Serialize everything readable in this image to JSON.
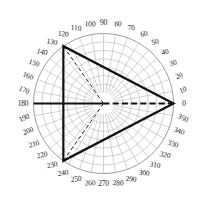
{
  "chart_data": {
    "type": "line",
    "title": "",
    "subtitle": "",
    "xlabel": "",
    "ylabel": "",
    "coordinate_system": "polar",
    "angular_unit": "degrees",
    "angular_range": [
      0,
      360
    ],
    "angular_tick_step": 10,
    "angular_tick_labels": [
      "0",
      "10",
      "20",
      "30",
      "40",
      "50",
      "60",
      "70",
      "80",
      "90",
      "100",
      "110",
      "120",
      "130",
      "140",
      "150",
      "160",
      "170",
      "180",
      "190",
      "200",
      "210",
      "220",
      "230",
      "240",
      "250",
      "260",
      "270",
      "280",
      "290",
      "300",
      "310",
      "320",
      "330",
      "340",
      "350"
    ],
    "angular_direction": "counterclockwise",
    "zero_angle_position": "east",
    "radial_rings": 7,
    "radial_inner_hole": true,
    "radial_tick_labels": [],
    "grid": true,
    "legend": false,
    "legend_position": "none",
    "series": [
      {
        "name": "triangle-envelope",
        "style": "solid-bold",
        "closed": true,
        "points": [
          {
            "angle": 0,
            "radius": 1.0
          },
          {
            "angle": 125,
            "radius": 1.0
          },
          {
            "angle": 235,
            "radius": 1.0
          }
        ]
      },
      {
        "name": "radial-ray-0",
        "style": "dashed-bold",
        "closed": false,
        "points": [
          {
            "angle": 0,
            "radius": 0.0
          },
          {
            "angle": 0,
            "radius": 1.0
          }
        ]
      },
      {
        "name": "radial-ray-180",
        "style": "solid-bold",
        "closed": false,
        "points": [
          {
            "angle": 180,
            "radius": 0.0
          },
          {
            "angle": 180,
            "radius": 1.0
          }
        ]
      },
      {
        "name": "radial-ray-125",
        "style": "dashed-thin",
        "closed": false,
        "points": [
          {
            "angle": 125,
            "radius": 0.0
          },
          {
            "angle": 125,
            "radius": 1.0
          }
        ]
      },
      {
        "name": "radial-ray-235",
        "style": "dashed-thin",
        "closed": false,
        "points": [
          {
            "angle": 235,
            "radius": 0.0
          },
          {
            "angle": 235,
            "radius": 1.0
          }
        ]
      }
    ],
    "annotations": []
  },
  "colors": {
    "background": "#ffffff",
    "grid": "#8d8d8d",
    "grid_minor": "#b5b5b5",
    "plot_stroke": "#111111",
    "label_text": "#1d1d1d"
  },
  "geometry": {
    "center_x": 103.5,
    "center_y": 103.5,
    "outer_radius": 70,
    "inner_radius": 11,
    "label_radius": 80.5
  }
}
